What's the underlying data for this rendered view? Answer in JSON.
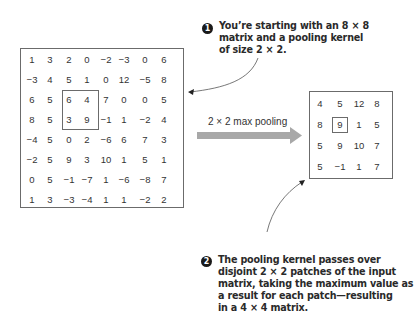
{
  "input_matrix": {
    "size": "8 × 8",
    "rows": [
      [
        "1",
        "3",
        "2",
        "0",
        "−2",
        "−3",
        "0",
        "6"
      ],
      [
        "−3",
        "4",
        "5",
        "1",
        "0",
        "12",
        "−5",
        "8"
      ],
      [
        "6",
        "5",
        "6",
        "4",
        "7",
        "0",
        "0",
        "5"
      ],
      [
        "8",
        "5",
        "3",
        "9",
        "−1",
        "1",
        "−2",
        "4"
      ],
      [
        "−4",
        "5",
        "0",
        "2",
        "−6",
        "6",
        "7",
        "3"
      ],
      [
        "−2",
        "5",
        "9",
        "3",
        "10",
        "1",
        "5",
        "1"
      ],
      [
        "0",
        "5",
        "−1",
        "−7",
        "1",
        "−6",
        "−8",
        "7"
      ],
      [
        "1",
        "3",
        "−3",
        "−4",
        "1",
        "1",
        "−2",
        "2"
      ]
    ],
    "highlighted_patch": {
      "row_start": 2,
      "col_start": 2,
      "size": 2
    }
  },
  "output_matrix": {
    "size": "4 × 4",
    "rows": [
      [
        "4",
        "5",
        "12",
        "8"
      ],
      [
        "8",
        "9",
        "1",
        "5"
      ],
      [
        "5",
        "9",
        "10",
        "7"
      ],
      [
        "5",
        "−1",
        "1",
        "7"
      ]
    ],
    "highlighted_cell": {
      "row": 1,
      "col": 1
    }
  },
  "operation": {
    "label": "2 × 2 max pooling",
    "arrow_color": "#a8a8a8"
  },
  "annotations": [
    {
      "number": "1",
      "lines": [
        "You’re starting with an 8 × 8",
        "matrix and a pooling kernel",
        "of size 2 × 2."
      ]
    },
    {
      "number": "2",
      "lines": [
        "The pooling kernel passes over",
        "disjoint 2 × 2 patches of the input",
        "matrix, taking the maximum value as",
        "a result for each patch—resulting",
        "in a 4 × 4 matrix."
      ]
    }
  ]
}
